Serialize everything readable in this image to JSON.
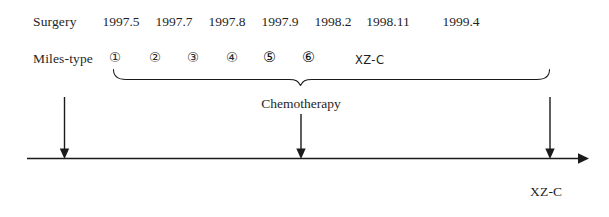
{
  "diagram": {
    "title_row": {
      "label": "Surgery",
      "dates": [
        "1997.5",
        "1997.7",
        "1997.8",
        "1997.9",
        "1998.2",
        "1998.11",
        "1999.4"
      ]
    },
    "treatment_row": {
      "label": "Miles-type",
      "cycles": [
        "①",
        "②",
        "③",
        "④",
        "⑤",
        "⑥"
      ],
      "regimen_label": "XZ-C"
    },
    "brace_caption": "Chemotherapy",
    "endpoint_label": "XZ-C",
    "colors": {
      "line": "#1a1a1a",
      "text": "#1f1f1f",
      "background": "#ffffff"
    }
  }
}
